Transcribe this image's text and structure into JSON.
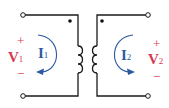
{
  "diagram": {
    "type": "coupled-inductors",
    "colors": {
      "wire": "#1a1a1a",
      "voltage": "#d9374f",
      "current": "#2b5aa0",
      "terminal_fill": "#ffffff"
    },
    "primary": {
      "voltage_label": "V",
      "voltage_sub": "1",
      "plus": "+",
      "minus": "−",
      "current_label": "I",
      "current_sub": "1",
      "dot": "top"
    },
    "secondary": {
      "voltage_label": "V",
      "voltage_sub": "2",
      "plus": "+",
      "minus": "−",
      "current_label": "I",
      "current_sub": "2",
      "dot": "top"
    }
  }
}
